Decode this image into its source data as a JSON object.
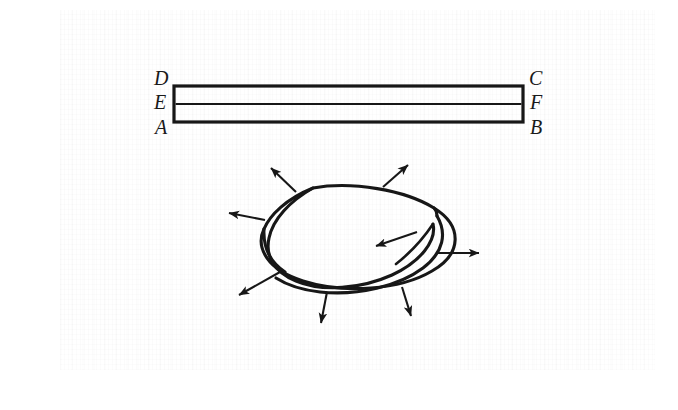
{
  "figure": {
    "caption": "",
    "background_color": "#ffffff",
    "ink_color": "#171717",
    "paper_texture": "faint-scanned-paper"
  },
  "strip_diagram": {
    "name": "rectangular-strip",
    "description": "Long thin rectangle divided by a horizontal midline, with corner and midpoint labels",
    "rect": {
      "x": 174,
      "y": 86,
      "width": 349,
      "height": 36
    },
    "midline_y": 104,
    "labels": [
      {
        "id": "D",
        "text": "D",
        "x": 155,
        "y": 76,
        "corner": "top-left"
      },
      {
        "id": "C",
        "text": "C",
        "x": 531,
        "y": 76,
        "corner": "top-right"
      },
      {
        "id": "E",
        "text": "E",
        "x": 155,
        "y": 95,
        "corner": "mid-left"
      },
      {
        "id": "F",
        "text": "F",
        "x": 531,
        "y": 95,
        "corner": "mid-right"
      },
      {
        "id": "A",
        "text": "A",
        "x": 155,
        "y": 117,
        "corner": "bottom-left"
      },
      {
        "id": "B",
        "text": "B",
        "x": 531,
        "y": 117,
        "corner": "bottom-right"
      }
    ]
  },
  "mobius_diagram": {
    "name": "mobius-band",
    "description": "Mobius band drawn as a twisted elliptical ring with ten outward normal arrows",
    "center": {
      "x": 360,
      "y": 248
    },
    "arrows": [
      {
        "id": "arrow-top-left",
        "from": [
          296,
          192
        ],
        "to": [
          270,
          167
        ]
      },
      {
        "id": "arrow-top-right",
        "from": [
          383,
          187
        ],
        "to": [
          409,
          164
        ]
      },
      {
        "id": "arrow-left",
        "from": [
          265,
          220
        ],
        "to": [
          228,
          213
        ]
      },
      {
        "id": "arrow-lower-left",
        "from": [
          280,
          272
        ],
        "to": [
          237,
          296
        ]
      },
      {
        "id": "arrow-bottom-left",
        "from": [
          327,
          292
        ],
        "to": [
          320,
          325
        ]
      },
      {
        "id": "arrow-bottom-right",
        "from": [
          402,
          287
        ],
        "to": [
          412,
          318
        ]
      },
      {
        "id": "arrow-right",
        "from": [
          437,
          253
        ],
        "to": [
          481,
          253
        ]
      },
      {
        "id": "arrow-inner-interior",
        "from": [
          417,
          232
        ],
        "to": [
          374,
          247
        ]
      }
    ],
    "arrow_count": 8
  }
}
